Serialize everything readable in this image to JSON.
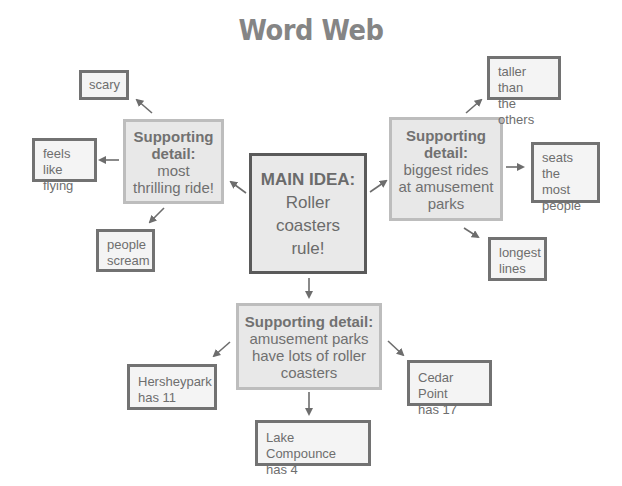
{
  "title": "Word Web",
  "main_idea": {
    "heading": "MAIN IDEA:",
    "lines": [
      "Roller",
      "coasters",
      "rule!"
    ]
  },
  "supporting_details": [
    {
      "id": "left",
      "heading_lines": [
        "Supporting",
        "detail:"
      ],
      "body_lines": [
        "most",
        "thrilling ride!"
      ],
      "leaves": [
        {
          "lines": [
            "scary"
          ]
        },
        {
          "lines": [
            "feels like",
            "flying"
          ]
        },
        {
          "lines": [
            "people",
            "scream"
          ]
        }
      ]
    },
    {
      "id": "right",
      "heading_lines": [
        "Supporting",
        "detail:"
      ],
      "body_lines": [
        "biggest rides",
        "at amusement",
        "parks"
      ],
      "leaves": [
        {
          "lines": [
            "taller than",
            "the others"
          ]
        },
        {
          "lines": [
            "seats the",
            "most",
            "people"
          ]
        },
        {
          "lines": [
            "longest",
            "lines"
          ]
        }
      ]
    },
    {
      "id": "bottom",
      "heading_lines": [
        "Supporting detail:"
      ],
      "body_lines": [
        "amusement parks",
        "have lots of roller",
        "coasters"
      ],
      "leaves": [
        {
          "lines": [
            "Hersheypark",
            "has 11"
          ]
        },
        {
          "lines": [
            "Lake Compounce",
            "has 4"
          ]
        },
        {
          "lines": [
            "Cedar Point",
            "has 17"
          ]
        }
      ]
    }
  ],
  "colors": {
    "arrow": "#6d6d6d",
    "leaf_border": "#727272",
    "main_border": "#5a5a5a",
    "support_border": "#bdbdbd",
    "box_fill": "#e8e8e8"
  }
}
